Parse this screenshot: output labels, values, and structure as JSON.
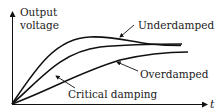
{
  "diagram": {
    "y_axis": {
      "label_line1": "Output",
      "label_line2": "voltage"
    },
    "x_axis": {
      "label": "t"
    },
    "curves": [
      {
        "name": "Underdamped",
        "label": "Underdamped",
        "color": "#111111"
      },
      {
        "name": "Critical damping",
        "label": "Critical damping",
        "color": "#111111"
      },
      {
        "name": "Overdamped",
        "label": "Overdamped",
        "color": "#111111"
      }
    ]
  }
}
